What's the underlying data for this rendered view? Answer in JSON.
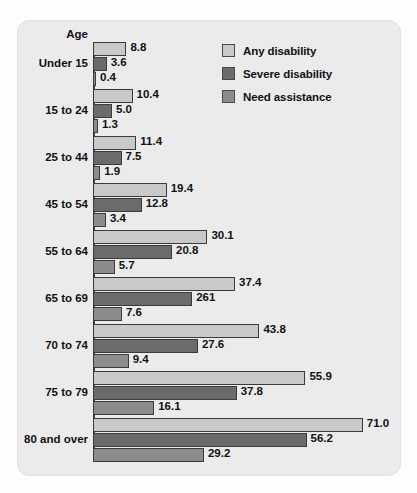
{
  "chart_data": {
    "type": "bar",
    "orientation": "horizontal",
    "title": "",
    "xlabel": "",
    "ylabel": "Age",
    "axis_caption": "Age",
    "categories": [
      "Under 15",
      "15 to 24",
      "25 to 44",
      "45 to 54",
      "55 to 64",
      "65 to 69",
      "70 to 74",
      "75 to 79",
      "80 and over"
    ],
    "series": [
      {
        "name": "Any disability",
        "color": "#c9c9c9",
        "values": [
          8.8,
          10.4,
          11.4,
          19.4,
          30.1,
          37.4,
          43.8,
          55.9,
          71.0
        ],
        "labels": [
          "8.8",
          "10.4",
          "11.4",
          "19.4",
          "30.1",
          "37.4",
          "43.8",
          "55.9",
          "71.0"
        ]
      },
      {
        "name": "Severe disability",
        "color": "#6b6b6b",
        "values": [
          3.6,
          5.0,
          7.5,
          12.8,
          20.8,
          26.1,
          27.6,
          37.8,
          56.2
        ],
        "labels": [
          "3.6",
          "5.0",
          "7.5",
          "12.8",
          "20.8",
          "261",
          "27.6",
          "37.8",
          "56.2"
        ]
      },
      {
        "name": "Need assistance",
        "color": "#8c8c8c",
        "values": [
          0.4,
          1.3,
          1.9,
          3.4,
          5.7,
          7.6,
          9.4,
          16.1,
          29.2
        ],
        "labels": [
          "0.4",
          "1.3",
          "1.9",
          "3.4",
          "5.7",
          "7.6",
          "9.4",
          "16.1",
          "29.2"
        ]
      }
    ],
    "xlim": [
      0,
      71.0
    ],
    "grid": false,
    "legend_position": "top-right",
    "value_labels": true
  },
  "legend": {
    "items": [
      {
        "label": "Any disability",
        "color": "#c9c9c9"
      },
      {
        "label": "Severe disability",
        "color": "#6b6b6b"
      },
      {
        "label": "Need assistance",
        "color": "#8c8c8c"
      }
    ]
  },
  "colors": {
    "panel_background": "#ebebeb",
    "page_background": "#fdfdfd",
    "axis": "#3a3a3a",
    "bar_outline": "#3b3b3b",
    "text": "#111111"
  },
  "layout": {
    "bar_origin_x": 93,
    "pixels_per_unit": 3.8,
    "bar_height": 14,
    "group_pitch": 47,
    "first_group_top": 42
  }
}
